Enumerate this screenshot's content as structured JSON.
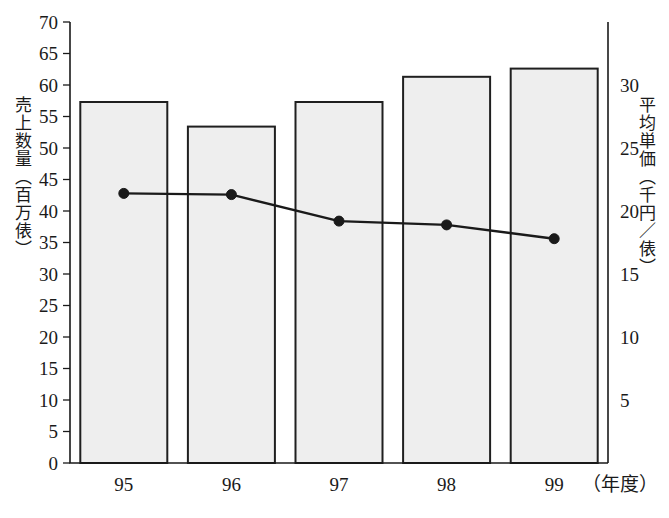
{
  "chart_data": {
    "type": "bar",
    "title": "",
    "subtitle": "",
    "categories": [
      "95",
      "96",
      "97",
      "98",
      "99"
    ],
    "xlabel": "（年度）",
    "xlabel_plain": "（年度）",
    "grid": false,
    "legend": "none",
    "series": [
      {
        "name": "売上数量（百万俵）",
        "type": "bar",
        "axis": "left",
        "values": [
          57.3,
          53.4,
          57.3,
          61.3,
          62.6
        ]
      },
      {
        "name": "平均単価（千円／俵）",
        "type": "line",
        "axis": "right",
        "values": [
          21.4,
          21.3,
          19.2,
          18.9,
          17.8
        ]
      }
    ],
    "left_axis": {
      "label": "売上数量（百万俵）",
      "ylim": [
        0,
        70
      ],
      "ticks": [
        0,
        5,
        10,
        15,
        20,
        25,
        30,
        35,
        40,
        45,
        50,
        55,
        60,
        65,
        70
      ],
      "tick_labels": [
        "0",
        "5",
        "10",
        "15",
        "20",
        "25",
        "30",
        "35",
        "40",
        "45",
        "50",
        "55",
        "60",
        "65",
        "70"
      ]
    },
    "right_axis": {
      "label": "平均単価（千円／俵）",
      "ylim": [
        0,
        35
      ],
      "ticks": [
        5,
        10,
        15,
        20,
        25,
        30
      ],
      "tick_labels": [
        "5",
        "10",
        "15",
        "20",
        "25",
        "30"
      ]
    },
    "colors": {
      "bar_fill": "#eeeeee",
      "bar_stroke": "#1f1f1f",
      "line": "#1a1a1a",
      "axis": "#1a1a1a",
      "background": "#ffffff"
    }
  }
}
